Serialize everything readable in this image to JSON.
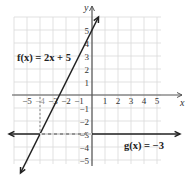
{
  "chart_data": {
    "type": "line",
    "title": "",
    "xlabel": "x",
    "ylabel": "y",
    "xlim": [
      -6,
      6
    ],
    "ylim": [
      -6,
      6
    ],
    "grid": true,
    "x_ticks": [
      -5,
      -4,
      -3,
      -2,
      -1,
      1,
      2,
      3,
      4,
      5
    ],
    "x_tick_labels": [
      "−5",
      "−4",
      "−3",
      "−2",
      "−1",
      "1",
      "2",
      "3",
      "4",
      "5"
    ],
    "y_ticks": [
      5,
      4,
      3,
      2,
      1,
      -1,
      -2,
      -3,
      -4,
      -5
    ],
    "y_tick_labels": [
      "5",
      "4",
      "3",
      "2",
      "1",
      "−1",
      "−2",
      "−3",
      "−4",
      "−5"
    ],
    "series": [
      {
        "name": "f(x) = 2x + 5",
        "label": "f(x) = 2x + 5",
        "type": "line",
        "slope": 2,
        "intercept": 5,
        "x": [
          -5.5,
          0.5
        ],
        "y": [
          -6,
          6
        ]
      },
      {
        "name": "g(x) = −3",
        "label": "g(x) = −3",
        "type": "line",
        "slope": 0,
        "intercept": -3,
        "x": [
          -6,
          6
        ],
        "y": [
          -3,
          -3
        ]
      }
    ],
    "annotations": [
      {
        "type": "intersection",
        "x": -4,
        "y": -3,
        "style": "dashed guide lines to axes"
      }
    ]
  },
  "labels": {
    "x_axis": "x",
    "y_axis": "y",
    "f_equation": "f(x) = 2x + 5",
    "g_equation": "g(x) = −3"
  },
  "colors": {
    "grid": "#d9d9d9",
    "axis": "#555555",
    "line": "#222222"
  }
}
